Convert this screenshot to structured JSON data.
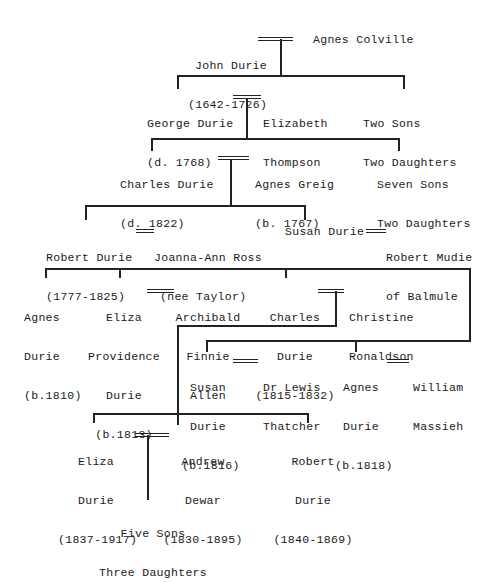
{
  "generations": [
    {
      "level": 1,
      "couples": [
        {
          "person": {
            "name": "John Durie",
            "dates": "(1642-1726)"
          },
          "spouse": {
            "name": "Agnes Colville"
          }
        }
      ]
    },
    {
      "level": 2,
      "couples": [
        {
          "person": {
            "name": "George Durie",
            "dates": "(d. 1768)"
          },
          "spouse": {
            "name": "Elizabeth",
            "line2": "Thompson"
          }
        }
      ],
      "others": {
        "line1": "Two Sons",
        "line2": "Two Daughters"
      }
    },
    {
      "level": 3,
      "couples": [
        {
          "person": {
            "name": "Charles Durie",
            "dates": "(d. 1822)"
          },
          "spouse": {
            "name": "Agnes Greig",
            "dates": "(b. 1767)"
          }
        }
      ],
      "others": {
        "line1": "Seven Sons",
        "line2": "Two Daughters"
      }
    },
    {
      "level": 4,
      "couples": [
        {
          "person": {
            "name": "Robert Durie",
            "dates": "(1777-1825)"
          },
          "spouse": {
            "name": "Joanna-Ann Ross",
            "line2": "(nee Taylor)"
          }
        },
        {
          "person": {
            "name": "Susan Durie"
          },
          "spouse": {
            "name": "Robert Mudie",
            "line2": "of Balmule"
          }
        }
      ]
    },
    {
      "level": 5,
      "children": [
        {
          "lines": [
            "Agnes",
            "Durie",
            "(b.1810)"
          ]
        },
        {
          "lines": [
            "Eliza",
            "Providence",
            "Durie",
            "(b.1813)"
          ],
          "spouse": {
            "lines": [
              "Archibald",
              "Finnie",
              "Allen"
            ]
          }
        },
        {
          "lines": [
            "Charles",
            "Durie",
            "(1815-1832)"
          ],
          "spouse": {
            "lines": [
              "Christine",
              "Ronaldson"
            ]
          }
        },
        {
          "lines": [
            "Susan",
            "Durie",
            "(b.1816)"
          ],
          "spouse": {
            "lines": [
              "Dr Lewis",
              "Thatcher"
            ]
          }
        },
        {
          "lines": [
            "Agnes",
            "Durie",
            "(b.1818)"
          ],
          "spouse": {
            "lines": [
              "William",
              "Massieh"
            ]
          }
        }
      ]
    },
    {
      "level": 6,
      "children": [
        {
          "lines": [
            "Eliza",
            "Durie",
            "(1837-1917)"
          ],
          "spouse": {
            "lines": [
              "Andrew",
              "Dewar",
              "(1830-1895)"
            ]
          }
        },
        {
          "lines": [
            "Robert",
            "Durie",
            "(1840-1869)"
          ]
        }
      ]
    },
    {
      "level": 7,
      "others": {
        "line1": "Five Sons",
        "line2": "Three Daughters"
      }
    }
  ]
}
